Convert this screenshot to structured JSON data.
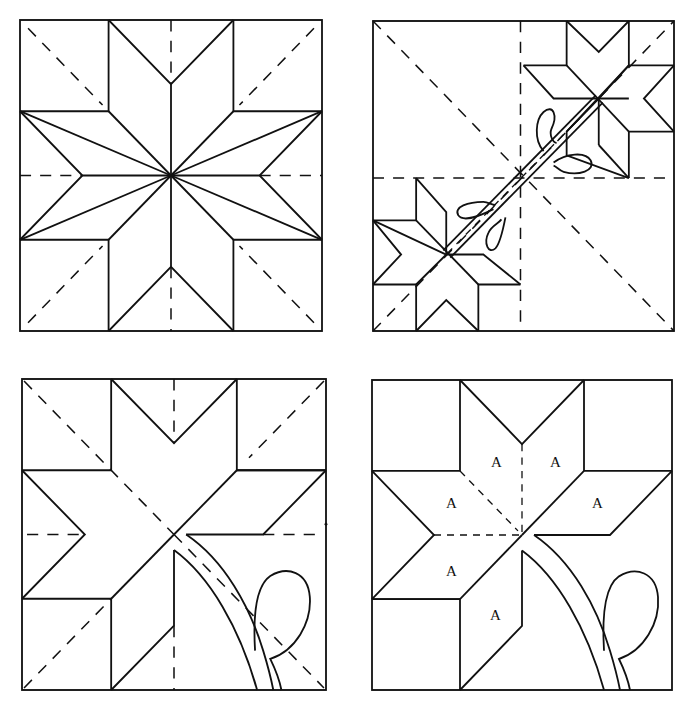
{
  "figure": {
    "colors": {
      "line": "#111111",
      "background": "#ffffff"
    }
  },
  "panels": [
    {
      "id": "top-left",
      "content": "Eight-pointed LeMoyne star with corner squares and side triangles; dashed diagonal and center fold lines"
    },
    {
      "id": "top-right",
      "content": "Two small eight-pointed stars in opposite quadrants joined by a diagonal appliqué stem with four leaf loops; dashed fold lines"
    },
    {
      "id": "bottom-left",
      "content": "Partial star (five diamonds) with curved stem and leaf appliqué in lower-right; dashed fold lines"
    },
    {
      "id": "bottom-right",
      "content": "Partial star with diamonds labeled A, curved stem and leaf appliqué"
    }
  ],
  "labels": {
    "diamond": "A",
    "panel4_labels": [
      "A",
      "A",
      "A",
      "A",
      "A",
      "A"
    ]
  }
}
